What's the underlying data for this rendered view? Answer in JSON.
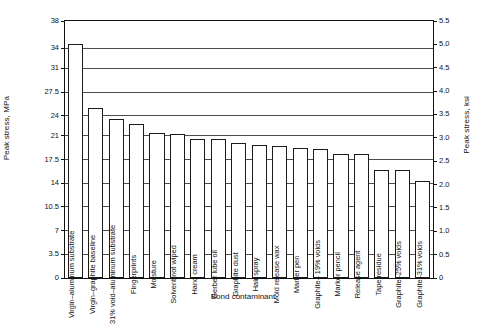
{
  "chart_data": {
    "type": "bar",
    "title": "",
    "xlabel": "Bond contaminant",
    "ylabel": "Peak stress, MPa",
    "ylabel_secondary": "Peak stress, ksi",
    "ylim": [
      0,
      38
    ],
    "ylim_secondary": [
      0,
      5.5
    ],
    "grid": true,
    "legend": "none",
    "yticks": [
      0,
      3.5,
      7,
      10.5,
      14,
      17.5,
      21,
      24,
      27.5,
      31,
      34,
      38
    ],
    "ytick_labels": [
      "0",
      "3.5",
      "7",
      "10.5",
      "14",
      "17.5",
      "21",
      "24",
      "27.5",
      "31",
      "34",
      "38"
    ],
    "yticks_secondary": [
      0,
      0.5,
      1.0,
      1.5,
      2.0,
      2.5,
      3.0,
      3.5,
      4.0,
      4.5,
      5.0,
      5.5
    ],
    "ytick_labels_secondary": [
      "0",
      "0.5",
      "1.0",
      "1.5",
      "2.0",
      "2.5",
      "3.0",
      "3.5",
      "4.0",
      "4.5",
      "5.0",
      "5.5"
    ],
    "categories": [
      "Virgin–aluminum substrate",
      "Virgin–graphite baseline",
      "31% void–aluminum substrate",
      "Fingerprints",
      "Moisture",
      "Solvent not wiped",
      "Hand cream",
      "Gerber lube oil",
      "Graphite dust",
      "Hair spray",
      "Mold release wax",
      "Marker pen",
      "Graphite– 19% voids",
      "Marker pencil",
      "Release agent",
      "Tape residue",
      "Graphite–25% voids",
      "Graphite–31% voids"
    ],
    "values": [
      34.6,
      25.1,
      23.5,
      22.8,
      21.4,
      21.3,
      20.6,
      20.5,
      19.9,
      19.7,
      19.5,
      19.2,
      19.1,
      18.3,
      18.3,
      16.0,
      16.0,
      14.4
    ],
    "values_secondary_ksi": [
      5.02,
      3.64,
      3.41,
      3.31,
      3.1,
      3.09,
      2.99,
      2.97,
      2.89,
      2.86,
      2.83,
      2.78,
      2.77,
      2.65,
      2.65,
      2.32,
      2.32,
      2.09
    ]
  }
}
